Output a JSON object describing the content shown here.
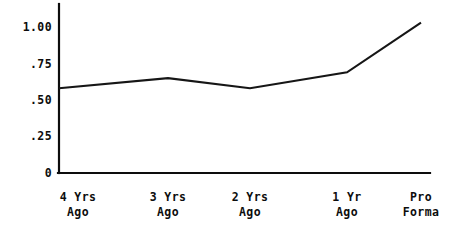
{
  "chart_data": {
    "type": "line",
    "title": "",
    "subtitle": "",
    "xlabel": "",
    "ylabel": "",
    "categories": [
      "4 Yrs\nAgo",
      "3 Yrs\nAgo",
      "2 Yrs\nAgo",
      "1 Yr\nAgo",
      "Pro\nForma"
    ],
    "category_lines": [
      [
        "4 Yrs",
        "Ago"
      ],
      [
        "3 Yrs",
        "Ago"
      ],
      [
        "2 Yrs",
        "Ago"
      ],
      [
        "1 Yr",
        "Ago"
      ],
      [
        "Pro",
        "Forma"
      ]
    ],
    "values": [
      0.58,
      0.65,
      0.58,
      0.69,
      1.03
    ],
    "series": [
      {
        "name": "",
        "values": [
          0.58,
          0.65,
          0.58,
          0.69,
          1.03
        ]
      }
    ],
    "ylim": [
      0,
      1.13
    ],
    "yticks": [
      0,
      0.25,
      0.5,
      0.75,
      1.0
    ],
    "ytick_labels": [
      "0",
      ".25",
      ".50",
      ".75",
      "1.00"
    ],
    "grid": false,
    "legend": false,
    "legend_position": "none",
    "line_color": "#161616",
    "axis_color": "#0d0d0d",
    "background_color": "#ffffff",
    "markers": false,
    "annotations": []
  },
  "axes": {
    "y_axis_name": "value-axis",
    "x_axis_name": "period-axis"
  }
}
